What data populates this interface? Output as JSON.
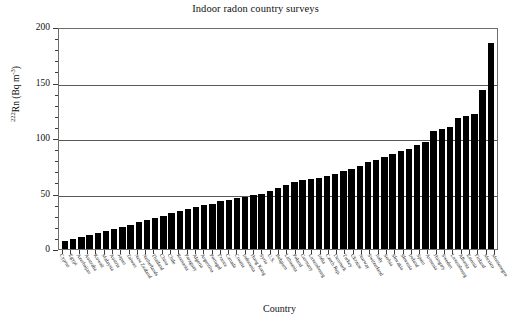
{
  "chart_data": {
    "type": "bar",
    "title": "Indoor radon country surveys",
    "xlabel": "Country",
    "ylabel": "222Rn (Bq m-3)",
    "ylabel_parts": {
      "superscript_isotope": "222",
      "element": "Rn",
      "unit_prefix": " (Bq m",
      "superscript_exponent": "-3",
      "unit_suffix": ")"
    },
    "ylim": [
      0,
      200
    ],
    "ytick_labels": [
      "0",
      "50",
      "100",
      "150",
      "200"
    ],
    "ytick_values": [
      0,
      50,
      100,
      150,
      200
    ],
    "yminor_step": 10,
    "gridlines": [
      50,
      100,
      150
    ],
    "grid": true,
    "legend": "none",
    "bar_color": "#000000",
    "categories": [
      "Cyprus",
      "Egypt",
      "Azerbaijan",
      "Australia",
      "Kuwait",
      "Malaysia",
      "Austria",
      "Japan",
      "Taiwan",
      "New Zealand",
      "Netherlands",
      "Thailand",
      "China",
      "Chile",
      "Romania",
      "Paraguay",
      "Algeria",
      "Argentina",
      "Portugal",
      "France",
      "Canada",
      "Croatia",
      "Indonesia",
      "Hong Kong",
      "Syria",
      "U.S.",
      "Belgium",
      "Lithuania",
      "Poland",
      "Germany",
      "Luxembourg",
      "India",
      "Czech Rep.",
      "Denmark",
      "Turkey",
      "Ukraine",
      "Norway",
      "Switzerland",
      "Italy",
      "Serbia",
      "Slovakia",
      "Slovenia",
      "Ireland",
      "Spain",
      "Armenia",
      "Hungary",
      "Sweden",
      "Luxembourg",
      "Albania",
      "Estonia",
      "Finland",
      "Mexico",
      "Montenegro"
    ],
    "values": [
      7,
      9,
      11,
      13,
      14,
      16,
      18,
      20,
      22,
      24,
      26,
      28,
      30,
      32,
      34,
      36,
      38,
      40,
      41,
      43,
      44,
      46,
      47,
      49,
      50,
      52,
      55,
      58,
      60,
      62,
      63,
      64,
      66,
      68,
      70,
      72,
      75,
      78,
      80,
      83,
      86,
      88,
      90,
      94,
      96,
      106,
      108,
      110,
      118,
      120,
      122,
      143,
      186
    ]
  }
}
